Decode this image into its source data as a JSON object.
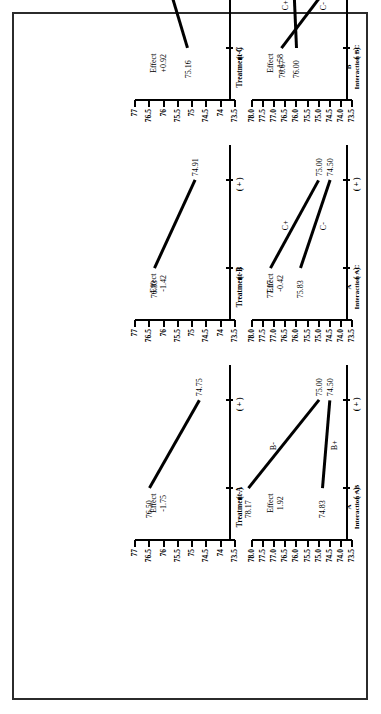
{
  "figure": {
    "orientation": "rotated-90-ccw",
    "border_color": "#2b2b2b",
    "line_color": "#000000",
    "background": "#ffffff"
  },
  "axis_labels": {
    "minus": "( - )",
    "plus": "( + )",
    "effect_word": "Effect"
  },
  "main_ticks": [
    "77",
    "76.5",
    "76",
    "75.5",
    "75",
    "74.5",
    "74",
    "73.5"
  ],
  "interaction_ticks": [
    "78.0",
    "77.5",
    "77.0",
    "76.5",
    "76.0",
    "75.5",
    "75.0",
    "74.5",
    "74.0",
    "73.5"
  ],
  "panels": [
    {
      "id": "treatment-a",
      "title": "Treatment A",
      "subtitle": "",
      "effect_label": "Effect",
      "effect_value": "-1.75",
      "ylim": [
        73.5,
        77.0
      ],
      "ticks": [
        "77",
        "76.5",
        "76",
        "75.5",
        "75",
        "74.5",
        "74",
        "73.5"
      ],
      "x_categories": [
        "( - )",
        "( + )"
      ],
      "series": [
        {
          "name": "",
          "label": "",
          "values": [
            76.5,
            74.75
          ],
          "point_labels": [
            "76.50",
            "74.75"
          ]
        }
      ]
    },
    {
      "id": "treatment-b",
      "title": "Treatment B",
      "subtitle": "",
      "effect_label": "Effect",
      "effect_value": "-1.42",
      "ylim": [
        73.5,
        77.0
      ],
      "ticks": [
        "77",
        "76.5",
        "76",
        "75.5",
        "75",
        "74.5",
        "74",
        "73.5"
      ],
      "x_categories": [
        "( - )",
        "( + )"
      ],
      "series": [
        {
          "name": "",
          "label": "",
          "values": [
            76.33,
            74.91
          ],
          "point_labels": [
            "76.33",
            "74.91"
          ]
        }
      ]
    },
    {
      "id": "treatment-c",
      "title": "Treatment C",
      "subtitle": "",
      "effect_label": "Effect",
      "effect_value": "+0.92",
      "ylim": [
        73.5,
        77.0
      ],
      "ticks": [
        "77",
        "76.5",
        "76",
        "75.5",
        "75",
        "74.5",
        "74",
        "73.5"
      ],
      "x_categories": [
        "( - )",
        "( + )"
      ],
      "series": [
        {
          "name": "",
          "label": "",
          "values": [
            75.16,
            76.08
          ],
          "point_labels": [
            "75.16",
            "76.08"
          ]
        }
      ]
    },
    {
      "id": "interaction-ab",
      "title": "A",
      "subtitle": "Interaction AB",
      "effect_label": "Effect",
      "effect_value": "1.92",
      "ylim": [
        73.5,
        78.0
      ],
      "ticks": [
        "78.0",
        "77.5",
        "77.0",
        "76.5",
        "76.0",
        "75.5",
        "75.0",
        "74.5",
        "74.0",
        "73.5"
      ],
      "x_categories": [
        "( - )",
        "( + )"
      ],
      "series": [
        {
          "name": "B-",
          "label": "B-",
          "values": [
            78.17,
            75.0
          ],
          "point_labels": [
            "78.17",
            "75.00"
          ]
        },
        {
          "name": "B+",
          "label": "B+",
          "values": [
            74.83,
            74.5
          ],
          "point_labels": [
            "74.83",
            "74.50"
          ]
        }
      ]
    },
    {
      "id": "interaction-ac",
      "title": "A",
      "subtitle": "Interaction AC",
      "effect_label": "Effect",
      "effect_value": "-0.42",
      "ylim": [
        73.5,
        78.0
      ],
      "ticks": [
        "78.0",
        "77.5",
        "77.0",
        "76.5",
        "76.0",
        "75.5",
        "75.0",
        "74.5",
        "74.0",
        "73.5"
      ],
      "x_categories": [
        "( - )",
        "( + )"
      ],
      "series": [
        {
          "name": "C+",
          "label": "C+",
          "values": [
            77.17,
            75.0
          ],
          "point_labels": [
            "77.17",
            "75.00"
          ]
        },
        {
          "name": "C-",
          "label": "C-",
          "values": [
            75.83,
            74.5
          ],
          "point_labels": [
            "75.83",
            "74.50"
          ]
        }
      ]
    },
    {
      "id": "interaction-bc",
      "title": "B",
      "subtitle": "Interaction BC",
      "effect_label": "Effect",
      "effect_value": "+1.58",
      "ylim": [
        73.5,
        78.0
      ],
      "ticks": [
        "78.0",
        "77.5",
        "77.0",
        "76.5",
        "76.0",
        "75.5",
        "75.0",
        "74.5",
        "74.0",
        "73.5"
      ],
      "x_categories": [
        "( - )",
        "( + )"
      ],
      "series": [
        {
          "name": "C+",
          "label": "C+",
          "values": [
            76.0,
            76.17
          ],
          "point_labels": [
            "76.00",
            "76.17"
          ]
        },
        {
          "name": "C-",
          "label": "C-",
          "values": [
            76.67,
            73.67
          ],
          "point_labels": [
            "76.67",
            "73.67"
          ]
        }
      ]
    }
  ],
  "chart_data": {
    "type": "line",
    "xlabel": "Factor level",
    "ylabel": "Response",
    "grid": false,
    "legend": "inline-series-labels",
    "subplots": [
      {
        "name": "Treatment A",
        "type": "line",
        "categories": [
          "( - )",
          "( + )"
        ],
        "series": [
          {
            "name": "main effect A",
            "values": [
              76.5,
              74.75
            ]
          }
        ],
        "effect": -1.75,
        "ylim": [
          73.5,
          77.0
        ],
        "yticks": [
          77,
          76.5,
          76,
          75.5,
          75,
          74.5,
          74,
          73.5
        ]
      },
      {
        "name": "Treatment B",
        "type": "line",
        "categories": [
          "( - )",
          "( + )"
        ],
        "series": [
          {
            "name": "main effect B",
            "values": [
              76.33,
              74.91
            ]
          }
        ],
        "effect": -1.42,
        "ylim": [
          73.5,
          77.0
        ],
        "yticks": [
          77,
          76.5,
          76,
          75.5,
          75,
          74.5,
          74,
          73.5
        ]
      },
      {
        "name": "Treatment C",
        "type": "line",
        "categories": [
          "( - )",
          "( + )"
        ],
        "series": [
          {
            "name": "main effect C",
            "values": [
              75.16,
              76.08
            ]
          }
        ],
        "effect": 0.92,
        "ylim": [
          73.5,
          77.0
        ],
        "yticks": [
          77,
          76.5,
          76,
          75.5,
          75,
          74.5,
          74,
          73.5
        ]
      },
      {
        "name": "Interaction AB",
        "type": "line",
        "xlabel": "A",
        "categories": [
          "( - )",
          "( + )"
        ],
        "series": [
          {
            "name": "B-",
            "values": [
              78.17,
              75.0
            ]
          },
          {
            "name": "B+",
            "values": [
              74.83,
              74.5
            ]
          }
        ],
        "effect": 1.92,
        "ylim": [
          73.5,
          78.0
        ],
        "yticks": [
          78.0,
          77.5,
          77.0,
          76.5,
          76.0,
          75.5,
          75.0,
          74.5,
          74.0,
          73.5
        ]
      },
      {
        "name": "Interaction AC",
        "type": "line",
        "xlabel": "A",
        "categories": [
          "( - )",
          "( + )"
        ],
        "series": [
          {
            "name": "C+",
            "values": [
              77.17,
              75.0
            ]
          },
          {
            "name": "C-",
            "values": [
              75.83,
              74.5
            ]
          }
        ],
        "effect": -0.42,
        "ylim": [
          73.5,
          78.0
        ],
        "yticks": [
          78.0,
          77.5,
          77.0,
          76.5,
          76.0,
          75.5,
          75.0,
          74.5,
          74.0,
          73.5
        ]
      },
      {
        "name": "Interaction BC",
        "type": "line",
        "xlabel": "B",
        "categories": [
          "( - )",
          "( + )"
        ],
        "series": [
          {
            "name": "C+",
            "values": [
              76.0,
              76.17
            ]
          },
          {
            "name": "C-",
            "values": [
              76.67,
              73.67
            ]
          }
        ],
        "effect": 1.58,
        "ylim": [
          73.5,
          78.0
        ],
        "yticks": [
          78.0,
          77.5,
          77.0,
          76.5,
          76.0,
          75.5,
          75.0,
          74.5,
          74.0,
          73.5
        ]
      }
    ]
  }
}
